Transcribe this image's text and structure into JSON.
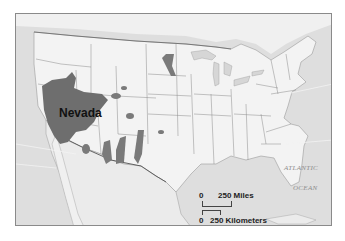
{
  "map": {
    "region": "United States",
    "highlight_label": "Nevada",
    "ocean_label_line1": "ATLANTIC",
    "ocean_label_line2": "OCEAN",
    "colors": {
      "land": "#f2f2f2",
      "water": "#dcdcdc",
      "highlight": "#6e6e6e",
      "borders": "#7a7a7a",
      "frame": "#8a8a8a"
    }
  },
  "scale": {
    "miles_zero": "0",
    "miles_label": "250 Miles",
    "km_zero": "0",
    "km_label": "250 Kilometers"
  }
}
